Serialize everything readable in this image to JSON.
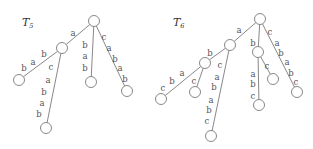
{
  "trees": [
    {
      "name": "T",
      "subscript": "5",
      "title_pos": [
        22,
        26
      ],
      "nodes": [
        {
          "id": "r",
          "x": 94,
          "y": 21
        },
        {
          "id": "a",
          "x": 62,
          "y": 48
        },
        {
          "id": "l1",
          "x": 19,
          "y": 80
        },
        {
          "id": "l2",
          "x": 46,
          "y": 128
        },
        {
          "id": "l3",
          "x": 91,
          "y": 82
        },
        {
          "id": "l4",
          "x": 127,
          "y": 91
        }
      ],
      "edges": [
        {
          "from": "r",
          "to": "a",
          "labels": [
            "a"
          ],
          "label_points": [
            [
              73,
              33
            ]
          ]
        },
        {
          "from": "a",
          "to": "l1",
          "labels": [
            "b",
            "a",
            "b"
          ],
          "label_points": [
            [
              44,
              54
            ],
            [
              33,
              62
            ],
            [
              24,
              68
            ]
          ]
        },
        {
          "from": "a",
          "to": "l2",
          "labels": [
            "c",
            "a",
            "b",
            "a",
            "b"
          ],
          "label_points": [
            [
              51,
              67
            ],
            [
              48,
              80
            ],
            [
              44,
              92
            ],
            [
              42,
              103
            ],
            [
              39,
              114
            ]
          ]
        },
        {
          "from": "r",
          "to": "l3",
          "labels": [
            "b",
            "a",
            "b"
          ],
          "label_points": [
            [
              85,
              45
            ],
            [
              85,
              56
            ],
            [
              85,
              68
            ]
          ]
        },
        {
          "from": "r",
          "to": "l4",
          "labels": [
            "c",
            "a",
            "b",
            "a",
            "b"
          ],
          "label_points": [
            [
              104,
              37
            ],
            [
              109,
              48
            ],
            [
              115,
              59
            ],
            [
              120,
              68
            ],
            [
              125,
              79
            ]
          ]
        }
      ]
    },
    {
      "name": "T",
      "subscript": "6",
      "title_pos": [
        173,
        26
      ],
      "nodes": [
        {
          "id": "r",
          "x": 260,
          "y": 19
        },
        {
          "id": "B",
          "x": 230,
          "y": 45
        },
        {
          "id": "C",
          "x": 205,
          "y": 63
        },
        {
          "id": "l1",
          "x": 161,
          "y": 99
        },
        {
          "id": "l2",
          "x": 195,
          "y": 92
        },
        {
          "id": "l3",
          "x": 211,
          "y": 136
        },
        {
          "id": "D",
          "x": 258,
          "y": 52
        },
        {
          "id": "l4",
          "x": 259,
          "y": 105
        },
        {
          "id": "l5",
          "x": 273,
          "y": 79
        },
        {
          "id": "l6",
          "x": 297,
          "y": 92
        }
      ],
      "edges": [
        {
          "from": "r",
          "to": "B",
          "labels": [
            "a"
          ],
          "label_points": [
            [
              239,
              30
            ]
          ]
        },
        {
          "from": "B",
          "to": "C",
          "labels": [
            "b"
          ],
          "label_points": [
            [
              210,
              53
            ]
          ]
        },
        {
          "from": "C",
          "to": "l1",
          "labels": [
            "a",
            "b",
            "c"
          ],
          "label_points": [
            [
              182,
              73
            ],
            [
              172,
              81
            ],
            [
              163,
              88
            ]
          ]
        },
        {
          "from": "C",
          "to": "l2",
          "labels": [
            "c"
          ],
          "label_points": [
            [
              194,
              81
            ]
          ]
        },
        {
          "from": "B",
          "to": "l3",
          "labels": [
            "c",
            "a",
            "b",
            "a",
            "b",
            "c"
          ],
          "label_points": [
            [
              220,
              65
            ],
            [
              217,
              77
            ],
            [
              214,
              87
            ],
            [
              211,
              100
            ],
            [
              209,
              110
            ],
            [
              207,
              121
            ]
          ]
        },
        {
          "from": "r",
          "to": "D",
          "labels": [
            "b"
          ],
          "label_points": [
            [
              253,
              43
            ]
          ]
        },
        {
          "from": "D",
          "to": "l4",
          "labels": [
            "a",
            "b",
            "c"
          ],
          "label_points": [
            [
              253,
              74
            ],
            [
              253,
              84
            ],
            [
              253,
              96
            ]
          ]
        },
        {
          "from": "D",
          "to": "l5",
          "labels": [
            "c"
          ],
          "label_points": [
            [
              267,
              66
            ]
          ]
        },
        {
          "from": "r",
          "to": "l6",
          "labels": [
            "c",
            "a",
            "b",
            "a",
            "b",
            "c"
          ],
          "label_points": [
            [
              270,
              32
            ],
            [
              277,
              43
            ],
            [
              281,
              53
            ],
            [
              287,
              62
            ],
            [
              291,
              73
            ],
            [
              296,
              82
            ]
          ]
        }
      ]
    }
  ],
  "style": {
    "node_radius": 5.5,
    "line_color": "#6a6a6a",
    "label_color": "#555555"
  }
}
